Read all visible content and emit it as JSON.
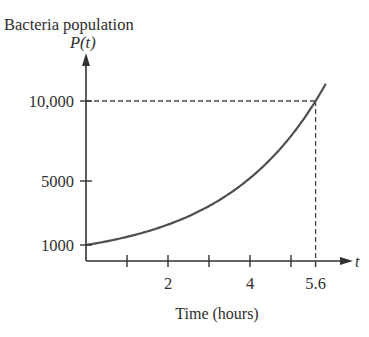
{
  "chart_data": {
    "type": "line",
    "title": "Bacteria population",
    "ylabel": "P(t)",
    "xlabel": "Time (hours)",
    "x_axis_var": "t",
    "xlim": [
      0,
      6.4
    ],
    "ylim": [
      0,
      12000
    ],
    "x_ticks": [
      1,
      2,
      3,
      4,
      5,
      5.6
    ],
    "x_tick_labels": [
      {
        "value": 2,
        "label": "2"
      },
      {
        "value": 4,
        "label": "4"
      },
      {
        "value": 5.6,
        "label": "5.6"
      }
    ],
    "y_ticks": [
      {
        "value": 1000,
        "label": "1000"
      },
      {
        "value": 5000,
        "label": "5000"
      },
      {
        "value": 10000,
        "label": "10,000"
      }
    ],
    "grid": false,
    "legend": null,
    "series": [
      {
        "name": "P(t)",
        "model": "P(t) = 1000 * e^(k t), k = ln(10)/5.6",
        "x": [
          0,
          0.5,
          1,
          1.5,
          2,
          2.5,
          3,
          3.5,
          4,
          4.5,
          5,
          5.6,
          5.85
        ],
        "values": [
          1000,
          1228,
          1509,
          1852,
          2276,
          2795,
          3433,
          4217,
          5180,
          6362,
          7814,
          10000,
          11089
        ]
      }
    ],
    "annotations": [
      {
        "type": "dashed-hline",
        "y": 10000,
        "x_from": 0,
        "x_to": 5.6
      },
      {
        "type": "dashed-vline",
        "x": 5.6,
        "y_from": 0,
        "y_to": 10000
      }
    ]
  },
  "colors": {
    "axis": "#333333",
    "curve": "#505050",
    "text": "#2e2e2e",
    "dash": "#444444"
  }
}
